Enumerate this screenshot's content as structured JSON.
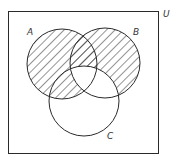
{
  "diagram": {
    "type": "venn-3-set",
    "universe": {
      "label": "U",
      "x": 8,
      "y": 11,
      "width": 151,
      "height": 143
    },
    "sets": [
      {
        "id": "A",
        "label": "A",
        "cx": 62,
        "cy": 64,
        "r": 35,
        "label_x": 27,
        "label_y": 35
      },
      {
        "id": "B",
        "label": "B",
        "cx": 105,
        "cy": 63,
        "r": 35,
        "label_x": 133,
        "label_y": 35
      },
      {
        "id": "C",
        "label": "C",
        "cx": 84,
        "cy": 101,
        "r": 35,
        "label_x": 107,
        "label_y": 139
      }
    ],
    "shaded_regions": [
      "A only",
      "B only",
      "A∩B∩C'",
      "A∩C∩B'"
    ],
    "unshaded_regions": [
      "A∩B∩C",
      "B∩C∩A'",
      "C only",
      "outside A∪B∪C"
    ],
    "shaded_expression": "(A − (B ∩ C)) ∪ (B − C)",
    "colors": {
      "stroke": "#2a2a2a",
      "hatch": "#2a2a2a",
      "background": "#ffffff"
    }
  }
}
